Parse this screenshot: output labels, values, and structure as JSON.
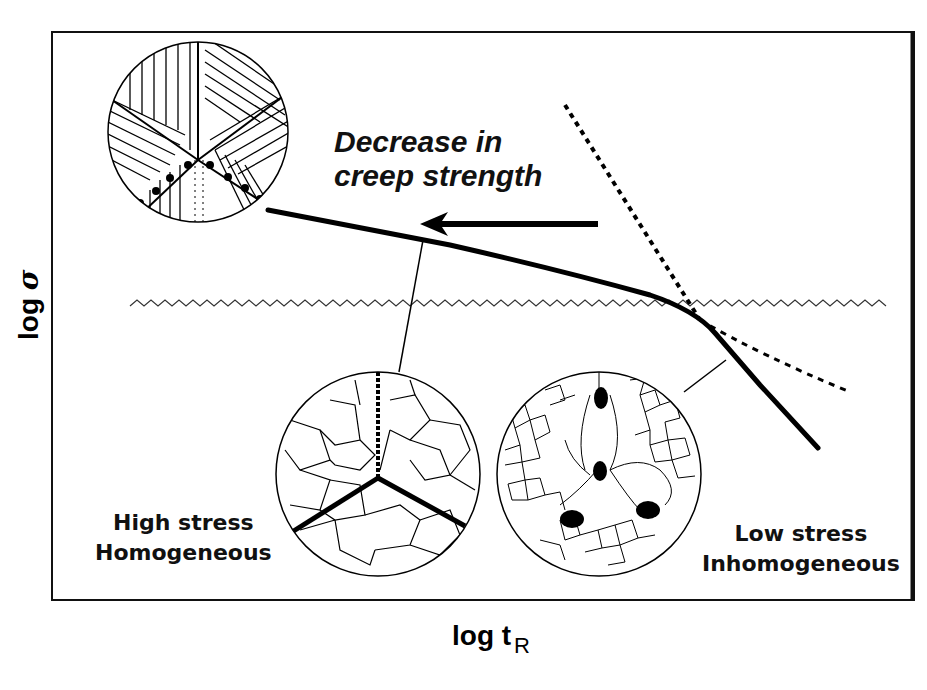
{
  "diagram": {
    "annotation": {
      "line1": "Decrease in",
      "line2": "creep strength"
    },
    "axes": {
      "x_label": "log t",
      "x_subscript": "R",
      "y_label": "log",
      "y_symbol": "σ"
    },
    "regimes": {
      "high_stress": {
        "line1": "High stress",
        "line2": "Homogeneous"
      },
      "low_stress": {
        "line1": "Low stress",
        "line2": "Inhomogeneous"
      }
    },
    "colors": {
      "ink": "#000000",
      "background": "#ffffff",
      "frame": "#111111"
    }
  }
}
